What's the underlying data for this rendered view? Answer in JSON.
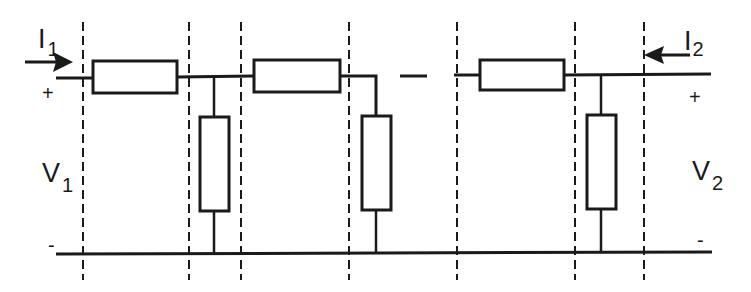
{
  "diagram": {
    "type": "ladder network (cascaded two-port sections)",
    "colors": {
      "line": "#1a1a1a",
      "background": "#ffffff"
    },
    "input_port": {
      "current_label": "I",
      "current_subscript": "1",
      "voltage_label": "V",
      "voltage_subscript": "1",
      "plus_sign": "+",
      "minus_sign": "-"
    },
    "output_port": {
      "current_label": "I",
      "current_subscript": "2",
      "voltage_label": "V",
      "voltage_subscript": "2",
      "plus_sign": "+",
      "minus_sign": "-"
    },
    "continuation_symbol": "—",
    "series_resistors": [
      {
        "x": 93,
        "y": 61,
        "w": 84,
        "h": 32
      },
      {
        "x": 254,
        "y": 60,
        "w": 86,
        "h": 32
      },
      {
        "x": 480,
        "y": 60,
        "w": 84,
        "h": 30
      }
    ],
    "shunt_resistors": [
      {
        "x": 200,
        "y": 117,
        "w": 29,
        "h": 94
      },
      {
        "x": 362,
        "y": 116,
        "w": 29,
        "h": 94
      },
      {
        "x": 587,
        "y": 115,
        "w": 29,
        "h": 94
      }
    ],
    "section_boundaries_x": [
      83,
      189,
      241,
      349,
      457,
      575,
      644
    ]
  }
}
